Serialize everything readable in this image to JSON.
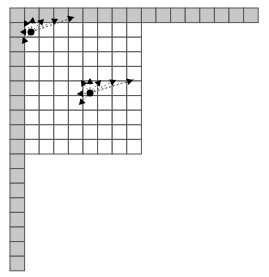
{
  "diagram": {
    "origin": [
      10,
      8
    ],
    "cell": 14.6,
    "top_row_cells": 17,
    "left_col_cells": 18,
    "inner_cols": 9,
    "inner_rows": 9,
    "colors": {
      "shaded": "#c8c8c8",
      "grid_line": "#555555",
      "background": "#ffffff",
      "point": "#000000"
    },
    "points": [
      {
        "id": "point-1",
        "x": 31,
        "y": 32,
        "arrows": [
          {
            "x": 24,
            "y": 20
          },
          {
            "x": 33,
            "y": 17
          },
          {
            "x": 44,
            "y": 19
          },
          {
            "x": 58,
            "y": 19
          },
          {
            "x": 74,
            "y": 17
          },
          {
            "x": 20,
            "y": 32
          },
          {
            "x": 22,
            "y": 44
          }
        ],
        "dotted_line_end": {
          "x": 76,
          "y": 17
        }
      },
      {
        "id": "point-2",
        "x": 90,
        "y": 93,
        "arrows": [
          {
            "x": 81,
            "y": 80
          },
          {
            "x": 90,
            "y": 78
          },
          {
            "x": 101,
            "y": 80
          },
          {
            "x": 116,
            "y": 80
          },
          {
            "x": 133,
            "y": 80
          },
          {
            "x": 77,
            "y": 94
          },
          {
            "x": 79,
            "y": 105
          }
        ],
        "dotted_line_end": {
          "x": 135,
          "y": 79
        }
      }
    ]
  }
}
